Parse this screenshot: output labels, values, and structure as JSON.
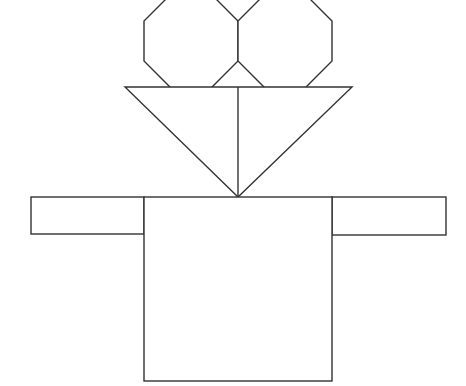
{
  "figure": {
    "stroke_color": "#333333",
    "background_color": "#ffffff",
    "shapes": [
      {
        "name": "left-octagon",
        "type": "octagon",
        "bounds": [
          144,
          -7,
          238,
          89
        ]
      },
      {
        "name": "right-octagon",
        "type": "octagon",
        "bounds": [
          238,
          -7,
          332,
          89
        ]
      },
      {
        "name": "inverted-triangle",
        "type": "triangle",
        "points": [
          [
            125,
            87
          ],
          [
            352,
            87
          ],
          [
            238,
            197
          ]
        ]
      },
      {
        "name": "triangle-divider",
        "type": "line",
        "points": [
          [
            238,
            87
          ],
          [
            238,
            197
          ]
        ]
      },
      {
        "name": "body-square",
        "type": "rect",
        "bounds": [
          144,
          197,
          332,
          381
        ]
      },
      {
        "name": "left-arm",
        "type": "rect",
        "bounds": [
          31,
          197,
          144,
          234
        ]
      },
      {
        "name": "right-arm",
        "type": "rect",
        "bounds": [
          332,
          197,
          446,
          235
        ]
      }
    ]
  }
}
